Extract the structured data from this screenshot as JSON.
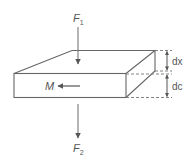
{
  "diagram": {
    "force_top": {
      "symbol": "F",
      "subscript": "1"
    },
    "force_bottom": {
      "symbol": "F",
      "subscript": "2"
    },
    "moment": {
      "label": "M"
    },
    "dimensions": {
      "upper": "dx",
      "lower": "dc"
    },
    "colors": {
      "line": "#666666",
      "arrow": "#555555",
      "text": "#555555"
    }
  }
}
